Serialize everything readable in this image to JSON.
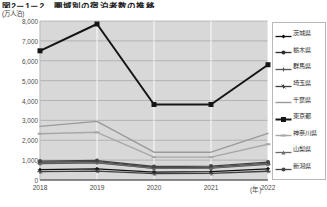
{
  "header": {
    "title": "図2－1－2　圏域別の宿泊者数の推移",
    "y_unit": "(万人泊)",
    "x_unit": "(年)"
  },
  "chart_data": {
    "type": "line",
    "title": "図2－1－2　圏域別の宿泊者数の推移",
    "xlabel": "(年)",
    "ylabel": "(万人泊)",
    "categories": [
      "2018",
      "2019",
      "2020",
      "2021",
      "2022"
    ],
    "x": [
      2018,
      2019,
      2020,
      2021,
      2022
    ],
    "ylim": [
      0,
      8000
    ],
    "ytick_step": 1000,
    "yticks": [
      "0",
      "1,000",
      "2,000",
      "3,000",
      "4,000",
      "5,000",
      "6,000",
      "7,000",
      "8,000"
    ],
    "grid": true,
    "legend_position": "right",
    "series": [
      {
        "name": "茨城県",
        "color": "#111111",
        "marker": "diamond",
        "width": 1.3,
        "values": [
          520,
          560,
          400,
          420,
          560
        ]
      },
      {
        "name": "栃木県",
        "color": "#2e2e2e",
        "marker": "circle",
        "width": 1.3,
        "values": [
          880,
          920,
          620,
          640,
          840
        ]
      },
      {
        "name": "群馬県",
        "color": "#555555",
        "marker": "plus",
        "width": 1.3,
        "values": [
          820,
          860,
          580,
          600,
          790
        ]
      },
      {
        "name": "埼玉県",
        "color": "#3f3f3f",
        "marker": "star",
        "width": 1.3,
        "values": [
          420,
          450,
          320,
          330,
          440
        ]
      },
      {
        "name": "千葉県",
        "color": "#9a9a9a",
        "marker": "none",
        "width": 1.4,
        "values": [
          2700,
          2950,
          1400,
          1400,
          2350
        ]
      },
      {
        "name": "東京都",
        "color": "#151515",
        "marker": "square",
        "width": 2.0,
        "values": [
          6500,
          7850,
          3800,
          3800,
          5800
        ]
      },
      {
        "name": "神奈川県",
        "color": "#a8a8a8",
        "marker": "hbar",
        "width": 1.4,
        "values": [
          2330,
          2400,
          1150,
          1150,
          1800
        ]
      },
      {
        "name": "山梨県",
        "color": "#6b6b6b",
        "marker": "triangle",
        "width": 1.3,
        "values": [
          860,
          900,
          590,
          610,
          820
        ]
      },
      {
        "name": "新潟県",
        "color": "#444444",
        "marker": "circle",
        "width": 1.3,
        "values": [
          950,
          980,
          680,
          700,
          900
        ]
      }
    ]
  }
}
